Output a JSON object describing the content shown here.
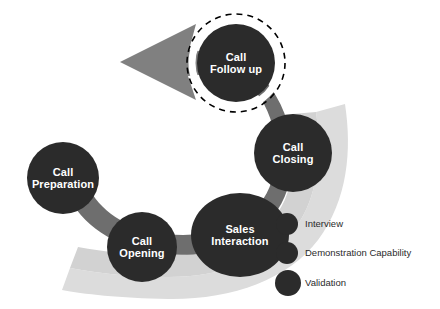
{
  "diagram": {
    "type": "process-flow-cycle",
    "title": "",
    "colors": {
      "node_fill": "#2b2b2b",
      "node_text": "#ffffff",
      "path_band": "#6e6e6e",
      "arrow_head": "#808080",
      "ribbon": "#dcdcdc",
      "background": "#ffffff",
      "dashed_ring": "#000000",
      "legend_text": "#2b2b2b"
    },
    "nodes": [
      {
        "id": "call-preparation",
        "label": "Call\nPreparation",
        "shape": "circle",
        "cx": 63,
        "cy": 178,
        "rx": 36,
        "ry": 36,
        "font_size": 11,
        "highlighted": false
      },
      {
        "id": "call-opening",
        "label": "Call\nOpening",
        "shape": "circle",
        "cx": 142,
        "cy": 247,
        "rx": 35,
        "ry": 35,
        "font_size": 11,
        "highlighted": false
      },
      {
        "id": "sales-interaction",
        "label": "Sales\nInteraction",
        "shape": "ellipse",
        "cx": 240,
        "cy": 235,
        "rx": 49,
        "ry": 42,
        "font_size": 11,
        "highlighted": false
      },
      {
        "id": "call-closing",
        "label": "Call\nClosing",
        "shape": "circle",
        "cx": 293,
        "cy": 153,
        "rx": 39,
        "ry": 39,
        "font_size": 11,
        "highlighted": false
      },
      {
        "id": "call-follow-up",
        "label": "Call\nFollow up",
        "shape": "circle",
        "cx": 236,
        "cy": 63,
        "rx": 39,
        "ry": 39,
        "font_size": 11,
        "highlighted": true
      }
    ],
    "arrow": {
      "id": "return-arrow",
      "direction": "left",
      "tip_x": 120,
      "tip_y": 62
    }
  },
  "legend": {
    "items": [
      {
        "label": "Interview",
        "cx": 287,
        "cy": 224,
        "r": 11
      },
      {
        "label": "Demonstration Capability",
        "cx": 287,
        "cy": 253,
        "r": 11
      },
      {
        "label": "Validation",
        "cx": 288,
        "cy": 283,
        "r": 13
      }
    ],
    "text_x": 305
  }
}
